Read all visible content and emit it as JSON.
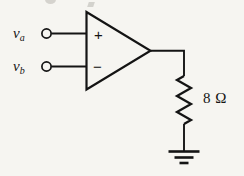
{
  "figure": {
    "background_color": "#f6f5f1",
    "ink_color": "#141414",
    "width": 244,
    "height": 176
  },
  "inputs": [
    {
      "id": "va",
      "symbol": "v",
      "subscript": "a",
      "terminal": "open-circle",
      "polarity_sign": "+",
      "polarity_name": "noninverting-input"
    },
    {
      "id": "vb",
      "symbol": "v",
      "subscript": "b",
      "terminal": "open-circle",
      "polarity_sign": "−",
      "polarity_name": "inverting-input"
    }
  ],
  "opamp": {
    "name": "operational-amplifier",
    "shape": "triangle",
    "plus_label": "+",
    "minus_label": "−"
  },
  "resistor": {
    "name": "load-resistor",
    "value": "8",
    "unit": "Ω",
    "label": "8 Ω",
    "style": "zigzag"
  },
  "ground": {
    "name": "ground-symbol",
    "bars": 3
  },
  "wires": [
    {
      "name": "wire-va-to-opamp"
    },
    {
      "name": "wire-vb-to-opamp"
    },
    {
      "name": "wire-output"
    },
    {
      "name": "wire-resistor-to-ground"
    }
  ]
}
